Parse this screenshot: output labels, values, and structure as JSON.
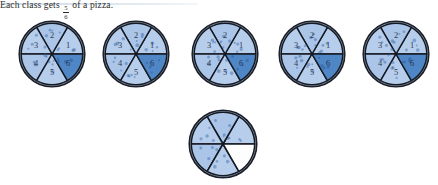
{
  "page": {
    "background_color": "#ffffff",
    "divider_color": "#c9d6e4"
  },
  "colors": {
    "crust": "#b9ccdf",
    "crust_edge": "#1a1f2b",
    "slice_light": "#aac5e8",
    "slice_light_alt": "#b6cdec",
    "slice_dark": "#4f86c6",
    "slice_empty": "#fdfdfd",
    "slice_outline": "#141922",
    "topping": "#2f5f9e",
    "label_text": "#1d2733",
    "caption_text": "#2b2b2b"
  },
  "diagram": {
    "slice_count": 6,
    "slice_labels": [
      "1",
      "2",
      "3",
      "4",
      "5",
      "6"
    ],
    "pizzas": [
      {
        "name": "pizza-1",
        "x": 17,
        "y": 19,
        "shaded_slices": [
          "6"
        ],
        "empty_slices": [],
        "show_labels": true
      },
      {
        "name": "pizza-2",
        "x": 101,
        "y": 19,
        "shaded_slices": [
          "6"
        ],
        "empty_slices": [],
        "show_labels": true
      },
      {
        "name": "pizza-3",
        "x": 190,
        "y": 19,
        "shaded_slices": [
          "6"
        ],
        "empty_slices": [],
        "show_labels": true
      },
      {
        "name": "pizza-4",
        "x": 277,
        "y": 19,
        "shaded_slices": [
          "6"
        ],
        "empty_slices": [],
        "show_labels": true
      },
      {
        "name": "pizza-5",
        "x": 361,
        "y": 19,
        "shaded_slices": [
          "6"
        ],
        "empty_slices": [],
        "show_labels": true
      },
      {
        "name": "pizza-6",
        "x": 187,
        "y": 108,
        "shaded_slices": [],
        "empty_slices": [
          "6"
        ],
        "show_labels": false
      }
    ]
  },
  "caption": {
    "x": 264,
    "y": 127,
    "prefix": "Each class gets",
    "fraction_numerator": "5",
    "fraction_denominator": "6",
    "suffix": "of a pizza.",
    "full_text": "Each class gets 5/6 of a pizza."
  }
}
